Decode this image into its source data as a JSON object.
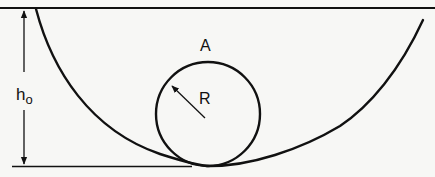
{
  "diagram": {
    "labels": {
      "height_main": "h",
      "height_sub": "o",
      "top_point": "A",
      "radius": "R"
    },
    "colors": {
      "stroke": "#111111",
      "background": "#f7f7f5"
    },
    "geometry": {
      "top_line_y": 8,
      "bottom_line_y": 166,
      "bottom_line_x_range": [
        12,
        192
      ],
      "height_arrow_x": 24,
      "ball_center": [
        208,
        114
      ],
      "ball_radius": 52,
      "radius_arrow_from": [
        206,
        118
      ],
      "radius_arrow_to": [
        172,
        86
      ]
    }
  }
}
